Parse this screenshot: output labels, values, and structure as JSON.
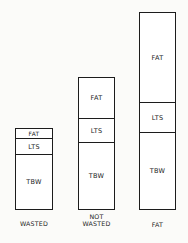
{
  "diagram": {
    "type": "stacked-composition-bars",
    "segments_order_top_to_bottom": [
      "FAT",
      "LTS",
      "TBW"
    ],
    "bars": [
      {
        "label_line1": "WASTED",
        "label_line2": "",
        "segments": [
          {
            "name": "FAT",
            "height_px": 9
          },
          {
            "name": "LTS",
            "height_px": 16
          },
          {
            "name": "TBW",
            "height_px": 57
          }
        ]
      },
      {
        "label_line1": "NOT",
        "label_line2": "WASTED",
        "segments": [
          {
            "name": "FAT",
            "height_px": 40
          },
          {
            "name": "LTS",
            "height_px": 24
          },
          {
            "name": "TBW",
            "height_px": 69
          }
        ]
      },
      {
        "label_line1": "FAT",
        "label_line2": "",
        "segments": [
          {
            "name": "FAT",
            "height_px": 89
          },
          {
            "name": "LTS",
            "height_px": 30
          },
          {
            "name": "TBW",
            "height_px": 79
          }
        ]
      }
    ]
  }
}
